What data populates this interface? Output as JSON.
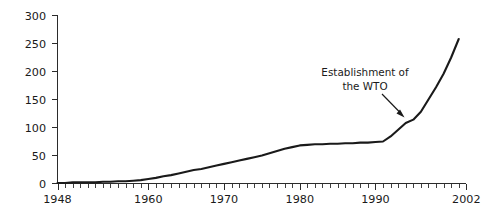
{
  "chart_data": {
    "type": "line",
    "title": "",
    "subtitle": "",
    "xlabel": "",
    "ylabel": "",
    "xlim": [
      1948,
      2002
    ],
    "ylim": [
      0,
      300
    ],
    "grid": false,
    "legend": null,
    "y_ticks": [
      "0",
      "50",
      "100",
      "150",
      "200",
      "250",
      "300"
    ],
    "y_tick_values": [
      0,
      50,
      100,
      150,
      200,
      250,
      300
    ],
    "x_ticks": [
      "1948",
      "1960",
      "1970",
      "1980",
      "1990",
      "2002"
    ],
    "x_tick_values": [
      1948,
      1960,
      1970,
      1980,
      1990,
      2002
    ],
    "x_minor_tick_interval": 1,
    "series": [
      {
        "name": "cumulative total",
        "x": [
          1948,
          1949,
          1950,
          1951,
          1952,
          1953,
          1954,
          1955,
          1956,
          1957,
          1958,
          1959,
          1960,
          1961,
          1962,
          1963,
          1964,
          1965,
          1966,
          1967,
          1968,
          1969,
          1970,
          1971,
          1972,
          1973,
          1974,
          1975,
          1976,
          1977,
          1978,
          1979,
          1980,
          1981,
          1982,
          1983,
          1984,
          1985,
          1986,
          1987,
          1988,
          1989,
          1990,
          1991,
          1992,
          1993,
          1994,
          1995,
          1996,
          1997,
          1998,
          1999,
          2000,
          2001
        ],
        "values": [
          1,
          1,
          2,
          2,
          2,
          2,
          3,
          3,
          4,
          4,
          5,
          6,
          8,
          10,
          13,
          15,
          18,
          21,
          24,
          26,
          29,
          32,
          35,
          38,
          41,
          44,
          47,
          50,
          54,
          58,
          62,
          65,
          68,
          69,
          70,
          70,
          71,
          71,
          72,
          72,
          73,
          73,
          74,
          75,
          84,
          96,
          108,
          114,
          128,
          150,
          172,
          196,
          225,
          258
        ]
      }
    ],
    "annotations": [
      {
        "text_line_1": "Establishment of",
        "text_line_2": "the WTO",
        "points_to_x": 1994,
        "points_to_y": 108
      }
    ]
  },
  "annotation": {
    "line1": "Establishment of",
    "line2": "the WTO"
  },
  "axes": {
    "y_labels": [
      "300",
      "250",
      "200",
      "150",
      "100",
      "50",
      "0"
    ],
    "x_labels": [
      "1948",
      "1960",
      "1970",
      "1980",
      "1990",
      "2002"
    ]
  },
  "colors": {
    "line": "#1a1a1a",
    "axis": "#2b2b2b",
    "text": "#1a1a1a",
    "background": "#ffffff"
  }
}
